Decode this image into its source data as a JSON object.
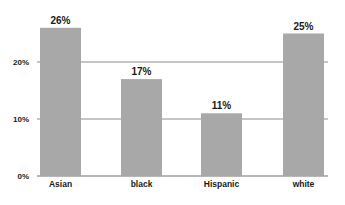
{
  "chart_data": {
    "type": "bar",
    "title": "",
    "xlabel": "",
    "ylabel": "",
    "categories": [
      "Asian",
      "black",
      "Hispanic",
      "white"
    ],
    "values": [
      26,
      17,
      11,
      25
    ],
    "value_labels": [
      "26%",
      "17%",
      "11%",
      "25%"
    ],
    "ylim": [
      0,
      30
    ],
    "yticks": [
      0,
      10,
      20
    ],
    "ytick_labels": [
      "0%",
      "10%",
      "20%"
    ],
    "grid": true,
    "legend": "none",
    "colors": {
      "bar": "#a8a8a8",
      "grid": "#6f6f6f",
      "text": "#1a1a1a"
    }
  }
}
